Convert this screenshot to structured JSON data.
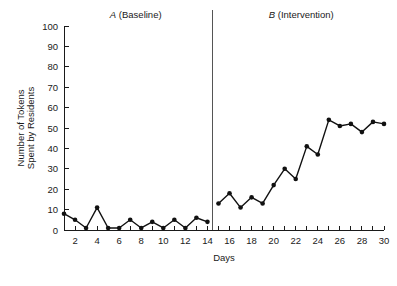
{
  "chart_data": {
    "type": "line",
    "title": "",
    "xlabel": "Days",
    "ylabel": "Number of Tokens Spent by Residents",
    "ylabel_line1": "Number of Tokens",
    "ylabel_line2": "Spent by Residents",
    "xlim": [
      1,
      30
    ],
    "ylim": [
      0,
      100
    ],
    "grid": false,
    "legend": "none",
    "ytick_labels": [
      "0",
      "10",
      "20",
      "30",
      "40",
      "50",
      "60",
      "70",
      "80",
      "90",
      "100"
    ],
    "ytick_values": [
      0,
      10,
      20,
      30,
      40,
      50,
      60,
      70,
      80,
      90,
      100
    ],
    "xtick_labels": [
      "2",
      "4",
      "6",
      "8",
      "10",
      "12",
      "14",
      "16",
      "18",
      "20",
      "22",
      "24",
      "26",
      "28",
      "30"
    ],
    "xtick_values": [
      2,
      4,
      6,
      8,
      10,
      12,
      14,
      16,
      18,
      20,
      22,
      24,
      26,
      28,
      30
    ],
    "xtick_minor_values": [
      1,
      3,
      5,
      7,
      9,
      11,
      13,
      15,
      17,
      19,
      21,
      23,
      25,
      27,
      29
    ],
    "phase_divider_x": 14.5,
    "annotations": [
      {
        "name": "phase-a-label",
        "italic_part": "A",
        "rest": " (Baseline)",
        "x": 7.5,
        "y_px": 18
      },
      {
        "name": "phase-b-label",
        "italic_part": "B",
        "rest": " (Intervention)",
        "x": 22.5,
        "y_px": 18
      }
    ],
    "series": [
      {
        "name": "Tokens spent",
        "color": "#111111",
        "x": [
          1,
          2,
          3,
          4,
          5,
          6,
          7,
          8,
          9,
          10,
          11,
          12,
          13,
          14,
          15,
          16,
          17,
          18,
          19,
          20,
          21,
          22,
          23,
          24,
          25,
          26,
          27,
          28,
          29,
          30
        ],
        "values": [
          8,
          5,
          1,
          11,
          1,
          1,
          5,
          1,
          4,
          1,
          5,
          1,
          6,
          4,
          13,
          18,
          11,
          16,
          13,
          22,
          30,
          25,
          41,
          37,
          54,
          51,
          52,
          48,
          53,
          52
        ],
        "segments": [
          {
            "phase": "A (Baseline)",
            "x": [
              1,
              2,
              3,
              4,
              5,
              6,
              7,
              8,
              9,
              10,
              11,
              12,
              13,
              14
            ],
            "values": [
              8,
              5,
              1,
              11,
              1,
              1,
              5,
              1,
              4,
              1,
              5,
              1,
              6,
              4
            ]
          },
          {
            "phase": "B (Intervention)",
            "x": [
              15,
              16,
              17,
              18,
              19,
              20,
              21,
              22,
              23,
              24,
              25,
              26,
              27,
              28,
              29,
              30
            ],
            "values": [
              13,
              18,
              11,
              16,
              13,
              22,
              30,
              25,
              41,
              37,
              54,
              51,
              52,
              48,
              53,
              52
            ]
          }
        ]
      }
    ]
  }
}
